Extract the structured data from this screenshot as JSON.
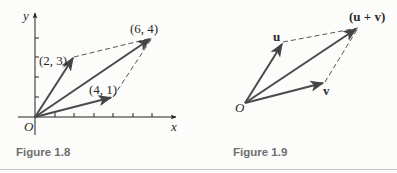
{
  "figures": [
    {
      "caption": "Figure 1.8",
      "axes": {
        "x_label": "x",
        "y_label": "y",
        "origin_label": "O"
      },
      "points": [
        {
          "label": "(2, 3)",
          "x": 2,
          "y": 3
        },
        {
          "label": "(4, 1)",
          "x": 4,
          "y": 1
        },
        {
          "label": "(6, 4)",
          "x": 6,
          "y": 4
        }
      ]
    },
    {
      "caption": "Figure 1.9",
      "origin_label": "O",
      "vectors": [
        {
          "label": "u"
        },
        {
          "label": "v"
        },
        {
          "label": "(u + v)"
        }
      ]
    }
  ],
  "colors": {
    "vector": "#4a4a4a",
    "dashed": "#555555",
    "caption": "#6f6f6f",
    "rule": "#c8c8c8"
  }
}
